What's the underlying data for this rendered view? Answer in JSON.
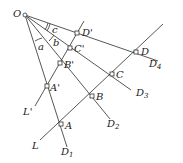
{
  "diagram": {
    "origin": {
      "label": "O",
      "x": 25,
      "y": 15
    },
    "rays": [
      {
        "name": "ray-OD4",
        "end_label": "D",
        "end_sub": "4",
        "x2": 158,
        "y2": 61,
        "lx": 149,
        "ly": 66
      },
      {
        "name": "ray-OD3",
        "end_label": "D",
        "end_sub": "3",
        "x2": 131,
        "y2": 90,
        "lx": 136,
        "ly": 96
      },
      {
        "name": "ray-OD2",
        "end_label": "D",
        "end_sub": "2",
        "x2": 110,
        "y2": 119,
        "lx": 107,
        "ly": 128
      },
      {
        "name": "ray-OD1",
        "end_label": "D",
        "end_sub": "1",
        "x2": 67,
        "y2": 147,
        "lx": 61,
        "ly": 154
      }
    ],
    "lines": [
      {
        "name": "line-L",
        "label": "L",
        "x1": 40,
        "y1": 140,
        "x2": 163,
        "y2": 24,
        "lx": 32,
        "ly": 148
      },
      {
        "name": "line-L-prime",
        "label": "L'",
        "x1": 36,
        "y1": 104,
        "x2": 84,
        "y2": 21,
        "lx": 26,
        "ly": 113
      }
    ],
    "points": [
      {
        "label": "D'",
        "x": 77,
        "y": 33,
        "lx": 82,
        "ly": 33
      },
      {
        "label": "C'",
        "x": 70,
        "y": 48,
        "lx": 74,
        "ly": 50
      },
      {
        "label": "B'",
        "x": 60,
        "y": 63,
        "lx": 64,
        "ly": 68
      },
      {
        "label": "A'",
        "x": 47,
        "y": 86,
        "lx": 50,
        "ly": 90
      },
      {
        "label": "D",
        "x": 136,
        "y": 52,
        "lx": 141,
        "ly": 52
      },
      {
        "label": "C",
        "x": 112,
        "y": 74,
        "lx": 116,
        "ly": 77
      },
      {
        "label": "B",
        "x": 92,
        "y": 96,
        "lx": 96,
        "ly": 100
      },
      {
        "label": "A",
        "x": 61,
        "y": 124,
        "lx": 65,
        "ly": 129
      }
    ],
    "angle_labels": [
      {
        "label": "c",
        "x": 53,
        "y": 34
      },
      {
        "label": "b",
        "x": 56,
        "y": 46
      },
      {
        "label": "a",
        "x": 37,
        "y": 50
      }
    ]
  }
}
